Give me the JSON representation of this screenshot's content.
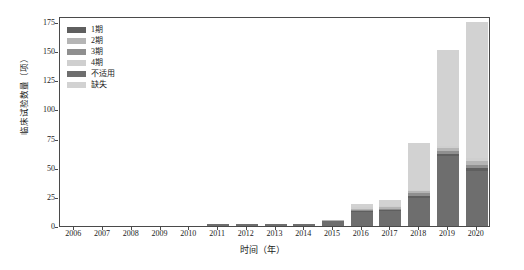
{
  "chart_data": {
    "type": "bar",
    "subtype": "stacked-bar",
    "title": "",
    "xlabel": "时间（年）",
    "ylabel": "临床试验数量（项）",
    "categories": [
      "2006",
      "2007",
      "2008",
      "2009",
      "2010",
      "2011",
      "2012",
      "2013",
      "2014",
      "2015",
      "2016",
      "2017",
      "2018",
      "2019",
      "2020"
    ],
    "ylim": [
      0,
      180
    ],
    "yticks": [
      0,
      25,
      50,
      75,
      100,
      125,
      150,
      175
    ],
    "grid": false,
    "legend_position": "upper-left-inside",
    "series": [
      {
        "name": "1期",
        "color": "#5f5f5f",
        "values": [
          0,
          0,
          0,
          0,
          0,
          0,
          0,
          0,
          0,
          0,
          1,
          1,
          2,
          2,
          3
        ]
      },
      {
        "name": "2期",
        "color": "#b5b5b5",
        "values": [
          0,
          0,
          0,
          0,
          0,
          0,
          0,
          0,
          0,
          1,
          1,
          1,
          2,
          3,
          4
        ]
      },
      {
        "name": "3期",
        "color": "#8f8f8f",
        "values": [
          0,
          0,
          0,
          0,
          0,
          0,
          0,
          0,
          0,
          0,
          1,
          1,
          2,
          2,
          2
        ]
      },
      {
        "name": "4期",
        "color": "#cfcfcf",
        "values": [
          0,
          0,
          0,
          0,
          0,
          0,
          0,
          0,
          0,
          0,
          1,
          1,
          1,
          2,
          2
        ]
      },
      {
        "name": "不适用",
        "color": "#6e6e6e",
        "values": [
          0,
          0,
          0,
          0,
          0,
          2,
          2,
          2,
          2,
          4,
          12,
          13,
          24,
          60,
          47
        ]
      },
      {
        "name": "缺失",
        "color": "#d2d2d2",
        "values": [
          0,
          0,
          0,
          0,
          0,
          0,
          0,
          0,
          0,
          0,
          3,
          5,
          40,
          82,
          117
        ]
      }
    ],
    "totals": [
      0,
      0,
      0,
      0,
      0,
      2,
      2,
      2,
      2,
      5,
      19,
      22,
      71,
      151,
      175
    ]
  },
  "legend": {
    "items": [
      {
        "label": "1期"
      },
      {
        "label": "2期"
      },
      {
        "label": "3期"
      },
      {
        "label": "4期"
      },
      {
        "label": "不适用"
      },
      {
        "label": "缺失"
      }
    ]
  }
}
